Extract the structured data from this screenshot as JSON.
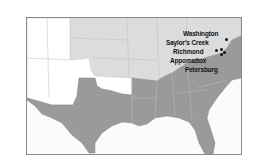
{
  "map": {
    "title": "Final campaigns of the Civil War",
    "colors": {
      "confederacy": "#9a9a9a",
      "union": "#dcdcdc",
      "territories": "#ffffff",
      "water": "#fbfbfb",
      "border": "#8a8a8a",
      "state_lines": "#c8c8c8",
      "marker": "#111111"
    },
    "regions": [
      {
        "name": "Confederate states",
        "fill": "confederacy"
      },
      {
        "name": "Union states",
        "fill": "union"
      },
      {
        "name": "Western territories",
        "fill": "territories"
      }
    ],
    "places": [
      {
        "id": "washington",
        "label": "Washington"
      },
      {
        "id": "saylors-creek",
        "label": "Saylor's Creek"
      },
      {
        "id": "richmond",
        "label": "Richmond"
      },
      {
        "id": "appomattox",
        "label": "Appomattox"
      },
      {
        "id": "petersburg",
        "label": "Petersburg"
      }
    ]
  }
}
